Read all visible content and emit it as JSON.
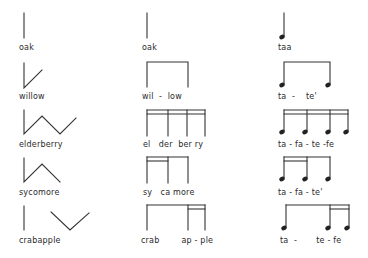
{
  "columns": [
    {
      "name": "contour-drawings"
    },
    {
      "name": "bracket-notation"
    },
    {
      "name": "rhythm-notation"
    }
  ],
  "rows": [
    {
      "word": "oak",
      "syllables": [
        "oak"
      ],
      "syllable_text": "oak",
      "rhythm_syllables": "taa",
      "contour": "single-vertical-line",
      "note_pattern": "quarter"
    },
    {
      "word": "willow",
      "syllables": [
        "wil",
        "low"
      ],
      "syllable_text": "wil  -  low",
      "rhythm_syllables": "ta  -    te'",
      "contour": "vertical-then-rising",
      "note_pattern": "two-eighths"
    },
    {
      "word": "elderberry",
      "syllables": [
        "el",
        "der",
        "ber",
        "ry"
      ],
      "syllable_text": "el   der  ber ry",
      "rhythm_syllables": "ta - fa - te -fe",
      "contour": "zigzag",
      "note_pattern": "four-sixteenths"
    },
    {
      "word": "sycomore",
      "syllables": [
        "sy",
        "ca",
        "more"
      ],
      "syllable_text": "sy   ca more",
      "rhythm_syllables": "ta - fa - te'",
      "contour": "vertical-then-peak",
      "note_pattern": "two-sixteenths-one-eighth"
    },
    {
      "word": "crabapple",
      "syllables": [
        "crab",
        "ap",
        "ple"
      ],
      "syllable_text": "crab        ap - ple",
      "rhythm_syllables": "ta  -       te - fe",
      "contour": "vertical-gap-valley",
      "note_pattern": "one-eighth-two-sixteenths"
    }
  ]
}
